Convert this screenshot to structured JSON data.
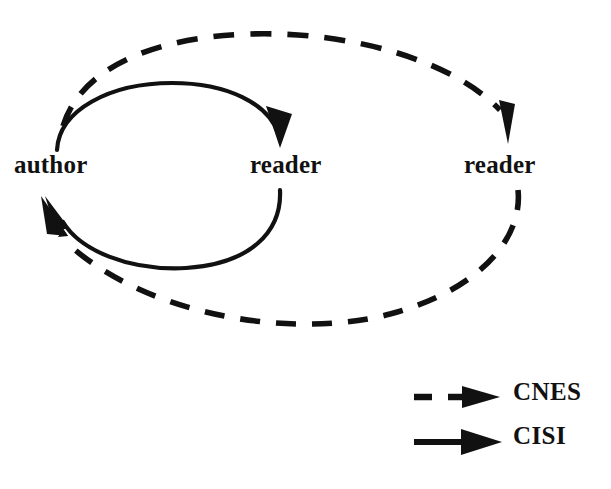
{
  "figure": {
    "type": "cycle-diagram",
    "background_color": "#ffffff",
    "stroke_color": "#111111"
  },
  "nodes": [
    {
      "id": "author",
      "label": "author",
      "x": 14,
      "y": 152
    },
    {
      "id": "reader-1",
      "label": "reader",
      "x": 250,
      "y": 152
    },
    {
      "id": "reader-2",
      "label": "reader",
      "x": 464,
      "y": 152
    }
  ],
  "edges": [
    {
      "id": "cisi-author-to-reader",
      "style": "solid",
      "series": "CISI",
      "from": "author",
      "to": "reader-1",
      "direction": "clockwise-top"
    },
    {
      "id": "cisi-reader-to-author",
      "style": "solid",
      "series": "CISI",
      "from": "reader-1",
      "to": "author",
      "direction": "clockwise-bottom"
    },
    {
      "id": "cnes-author-to-reader2",
      "style": "dashed",
      "series": "CNES",
      "from": "author",
      "to": "reader-2",
      "direction": "clockwise-top"
    },
    {
      "id": "cnes-reader2-to-author",
      "style": "dashed",
      "series": "CNES",
      "from": "reader-2",
      "to": "author",
      "direction": "clockwise-bottom"
    }
  ],
  "legend": {
    "position": "bottom-right",
    "items": [
      {
        "id": "cnes",
        "label": "CNES",
        "style": "dashed",
        "marker": "arrow"
      },
      {
        "id": "cisi",
        "label": "CISI",
        "style": "solid",
        "marker": "arrow"
      }
    ]
  }
}
